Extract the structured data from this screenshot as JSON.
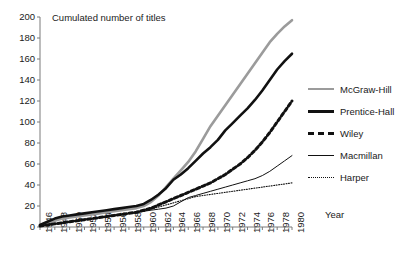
{
  "chart_data": {
    "type": "line",
    "title": "",
    "ylabel": "Cumulated number of titles",
    "xlabel": "Year",
    "ylim": [
      0,
      200
    ],
    "ytick_step": 20,
    "yticks": [
      200,
      180,
      160,
      140,
      120,
      100,
      80,
      60,
      40,
      20,
      0
    ],
    "xlim": [
      1946,
      1980
    ],
    "xtick_step": 2,
    "xticks": [
      1946,
      1948,
      1950,
      1952,
      1954,
      1956,
      1958,
      1960,
      1962,
      1964,
      1966,
      1968,
      1970,
      1972,
      1974,
      1976,
      1978,
      1980
    ],
    "grid": false,
    "legend_position": "right",
    "x": [
      1946,
      1947,
      1948,
      1949,
      1950,
      1951,
      1952,
      1953,
      1954,
      1955,
      1956,
      1957,
      1958,
      1959,
      1960,
      1961,
      1962,
      1963,
      1964,
      1965,
      1966,
      1967,
      1968,
      1969,
      1970,
      1971,
      1972,
      1973,
      1974,
      1975,
      1976,
      1977,
      1978,
      1979,
      1980
    ],
    "series": [
      {
        "name": "McGraw-Hill",
        "color": "#9b9b9b",
        "style": "solid-thick",
        "values": [
          2,
          4,
          6,
          8,
          9,
          10,
          11,
          12,
          13,
          14,
          15,
          16,
          17,
          18,
          20,
          24,
          30,
          38,
          46,
          54,
          62,
          72,
          84,
          96,
          106,
          116,
          126,
          136,
          146,
          156,
          166,
          176,
          184,
          191,
          197
        ]
      },
      {
        "name": "Prentice-Hall",
        "color": "#111111",
        "style": "solid-thick",
        "values": [
          2,
          5,
          8,
          10,
          11,
          12,
          13,
          14,
          15,
          16,
          17,
          18,
          19,
          20,
          22,
          26,
          31,
          37,
          45,
          50,
          56,
          63,
          70,
          76,
          83,
          92,
          99,
          106,
          113,
          121,
          130,
          140,
          150,
          158,
          165
        ]
      },
      {
        "name": "Wiley",
        "color": "#111111",
        "style": "dashed-thick",
        "values": [
          1,
          2,
          3,
          4,
          5,
          6,
          7,
          8,
          9,
          10,
          11,
          12,
          13,
          14,
          16,
          18,
          21,
          24,
          27,
          30,
          33,
          36,
          39,
          42,
          46,
          50,
          55,
          60,
          66,
          73,
          81,
          90,
          100,
          110,
          120
        ]
      },
      {
        "name": "Macmillan",
        "color": "#111111",
        "style": "solid-thin",
        "values": [
          1,
          2,
          3,
          4,
          5,
          6,
          7,
          8,
          9,
          10,
          11,
          12,
          13,
          14,
          15,
          16,
          17,
          18,
          20,
          24,
          28,
          30,
          32,
          34,
          36,
          38,
          40,
          42,
          44,
          46,
          49,
          53,
          58,
          63,
          68
        ]
      },
      {
        "name": "Harper",
        "color": "#111111",
        "style": "dotted-thin",
        "values": [
          1,
          2,
          3,
          4,
          5,
          6,
          7,
          8,
          9,
          10,
          11,
          12,
          13,
          14,
          15,
          17,
          19,
          21,
          23,
          25,
          27,
          29,
          30,
          31,
          32,
          33,
          34,
          35,
          36,
          37,
          38,
          39,
          40,
          41,
          42
        ]
      }
    ]
  },
  "legend": {
    "items": [
      {
        "label": "McGraw-Hill"
      },
      {
        "label": "Prentice-Hall"
      },
      {
        "label": "Wiley"
      },
      {
        "label": "Macmillan"
      },
      {
        "label": "Harper"
      }
    ]
  }
}
